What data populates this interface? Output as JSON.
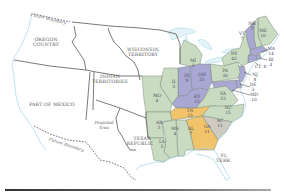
{
  "map": {
    "colors": {
      "green": "#c9dcc2",
      "purple": "#a9a7d3",
      "orange": "#f1c36a",
      "gray": "#cfcac2",
      "water": "#dff1f6",
      "coast": "#9fd6e6"
    },
    "territories": [
      {
        "id": "oregon",
        "line1": "OREGON",
        "line2": "COUNTRY"
      },
      {
        "id": "wisconsin",
        "line1": "WISCONSIN",
        "line2": "TERRITORY"
      },
      {
        "id": "indian",
        "line1": "INDIAN",
        "line2": "TERRITORIES"
      },
      {
        "id": "mexico",
        "line1": "PART OF MEXICO"
      },
      {
        "id": "disputed",
        "line1": "Disputed",
        "line2": "Area"
      },
      {
        "id": "texas",
        "line1": "TEXAS",
        "line2": "REPUBLIC"
      },
      {
        "id": "florida",
        "line1": "FL",
        "line2": "TERR."
      }
    ],
    "boundaries": [
      {
        "id": "north",
        "label": "Future Boundary"
      },
      {
        "id": "south",
        "label": "Future Boundary"
      }
    ],
    "states": [
      {
        "abbr": "ME",
        "votes": "10",
        "party": "green"
      },
      {
        "abbr": "NH",
        "votes": "7",
        "party": "green"
      },
      {
        "abbr": "VT",
        "votes": "7",
        "party": "purple"
      },
      {
        "abbr": "MA",
        "votes": "14",
        "party": "purple"
      },
      {
        "abbr": "RI",
        "votes": "4",
        "party": "purple"
      },
      {
        "abbr": "CT",
        "votes": "8",
        "party": "purple"
      },
      {
        "abbr": "NY",
        "votes": "42",
        "party": "green"
      },
      {
        "abbr": "NJ",
        "votes": "8",
        "party": "purple"
      },
      {
        "abbr": "PA",
        "votes": "30",
        "party": "green"
      },
      {
        "abbr": "DE",
        "votes": "3",
        "party": "purple"
      },
      {
        "abbr": "MD",
        "votes": "10",
        "party": "purple"
      },
      {
        "abbr": "VA",
        "votes": "23",
        "party": "green"
      },
      {
        "abbr": "NC",
        "votes": "15",
        "party": "green"
      },
      {
        "abbr": "SC",
        "votes": "11",
        "party": "gray"
      },
      {
        "abbr": "GA",
        "votes": "11",
        "party": "orange"
      },
      {
        "abbr": "TN",
        "votes": "15",
        "party": "orange"
      },
      {
        "abbr": "KY",
        "votes": "15",
        "party": "purple"
      },
      {
        "abbr": "OH",
        "votes": "21",
        "party": "purple"
      },
      {
        "abbr": "IN",
        "votes": "9",
        "party": "purple"
      },
      {
        "abbr": "IL",
        "votes": "5",
        "party": "green"
      },
      {
        "abbr": "MI",
        "votes": "3",
        "party": "green"
      },
      {
        "abbr": "MO",
        "votes": "4",
        "party": "green"
      },
      {
        "abbr": "AR",
        "votes": "3",
        "party": "green"
      },
      {
        "abbr": "MS",
        "votes": "4",
        "party": "green"
      },
      {
        "abbr": "AL",
        "votes": "7",
        "party": "green"
      },
      {
        "abbr": "LA",
        "votes": "5",
        "party": "green"
      }
    ]
  }
}
